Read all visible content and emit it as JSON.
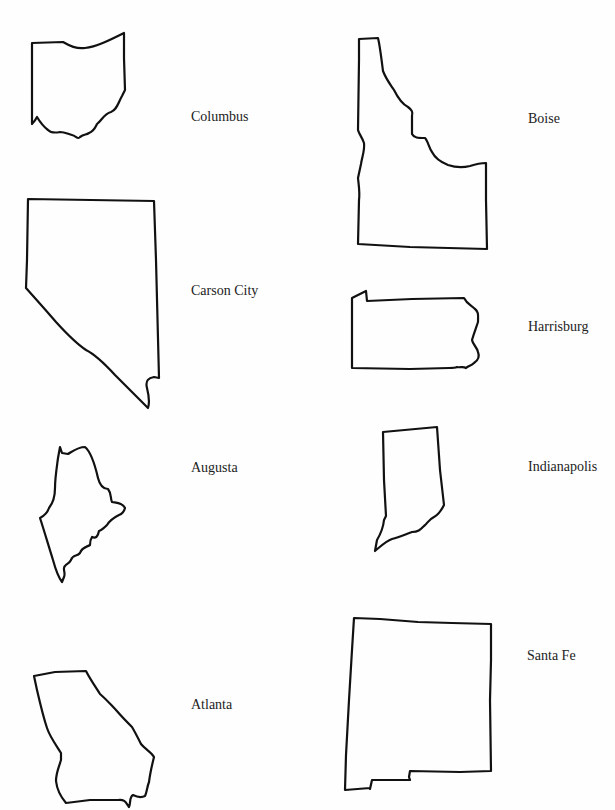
{
  "worksheet": {
    "title": "",
    "left_column": [
      {
        "state": "Ohio",
        "capital": "Columbus"
      },
      {
        "state": "Nevada",
        "capital": "Carson City"
      },
      {
        "state": "Maine",
        "capital": "Augusta"
      },
      {
        "state": "Georgia",
        "capital": "Atlanta"
      }
    ],
    "right_column": [
      {
        "state": "Idaho",
        "capital": "Boise"
      },
      {
        "state": "Pennsylvania",
        "capital": "Harrisburg"
      },
      {
        "state": "Indiana",
        "capital": "Indianapolis"
      },
      {
        "state": "New Mexico",
        "capital": "Santa Fe"
      }
    ]
  },
  "colors": {
    "outline": "#111111",
    "text": "#222222",
    "background": "#fefefe"
  }
}
